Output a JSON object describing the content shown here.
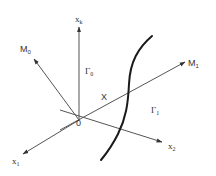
{
  "diagram": {
    "type": "coordinate-system-sketch",
    "axes": [
      {
        "id": "xk",
        "label": "x",
        "subscript": "k"
      },
      {
        "id": "x1",
        "label": "x",
        "subscript": "1"
      },
      {
        "id": "x2",
        "label": "x",
        "subscript": "2"
      },
      {
        "id": "M0",
        "label": "M",
        "subscript": "0"
      },
      {
        "id": "M1",
        "label": "M",
        "subscript": "1"
      }
    ],
    "origin_label": "0",
    "point_label": "X",
    "regions": [
      {
        "id": "gamma0",
        "label": "Γ",
        "subscript": "0"
      },
      {
        "id": "gamma1",
        "label": "Γ",
        "subscript": "1"
      }
    ],
    "curve": "boundary curve separating regions Γ0 and Γ1"
  }
}
